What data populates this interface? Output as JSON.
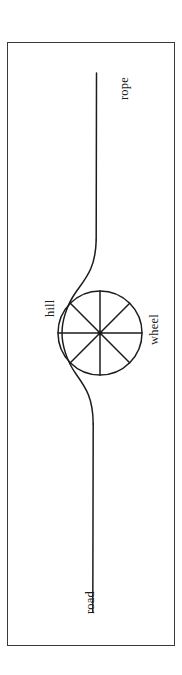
{
  "figure": {
    "frame": {
      "visible": true,
      "stroke_color": "#3a3a3a"
    },
    "orientation": "rotated-90-ccw",
    "stroke_color": "#1c1c1c",
    "background_color": "#ffffff",
    "labels": [
      {
        "id": "rope",
        "text": "rope"
      },
      {
        "id": "hill",
        "text": "hill"
      },
      {
        "id": "wheel",
        "text": "wheel"
      },
      {
        "id": "road",
        "text": "road"
      }
    ],
    "parts": {
      "rope": {
        "name": "rope",
        "description": "straight line segment leading away from the wheel"
      },
      "road": {
        "name": "road",
        "description": "straight line segment leading to the wheel"
      },
      "hill": {
        "name": "hill",
        "description": "smooth S-shaped bump in the road surface"
      },
      "wheel": {
        "name": "wheel",
        "description": "circle with 8 spokes radiating from a hub",
        "spokes": 8
      }
    }
  }
}
